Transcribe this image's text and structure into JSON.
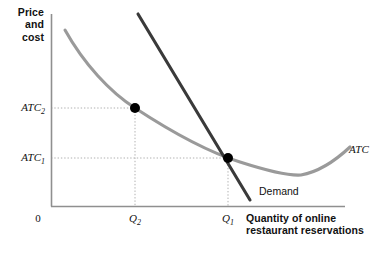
{
  "chart_data": {
    "type": "line",
    "title": "",
    "xlabel": "Quantity of online restaurant reservations",
    "ylabel": "Price and cost",
    "grid": false,
    "legend": "inline-annotations",
    "origin_label": "0",
    "axis_ranges": {
      "x": [
        0,
        1
      ],
      "y": [
        0,
        1
      ]
    },
    "y_ticks": [
      {
        "label": "ATC",
        "subscript": "1",
        "pixel_y": 158
      },
      {
        "label": "ATC",
        "subscript": "2",
        "pixel_y": 108
      }
    ],
    "x_ticks": [
      {
        "label": "Q",
        "subscript": "2",
        "pixel_x": 135
      },
      {
        "label": "Q",
        "subscript": "1",
        "pixel_x": 228
      }
    ],
    "series": [
      {
        "name": "ATC",
        "annotation": "ATC",
        "color": "#9a9a9a",
        "style": "u-shaped-curve",
        "points": [
          [
            65,
            30
          ],
          [
            84,
            60
          ],
          [
            104,
            82
          ],
          [
            135,
            108
          ],
          [
            170,
            131
          ],
          [
            200,
            147
          ],
          [
            228,
            158
          ],
          [
            258,
            167
          ],
          [
            285,
            173
          ],
          [
            300,
            175
          ],
          [
            318,
            170
          ],
          [
            334,
            160
          ],
          [
            350,
            147
          ]
        ]
      },
      {
        "name": "Demand",
        "annotation": "Demand",
        "color": "#3a3a3a",
        "style": "straight-downward-sloping",
        "points": [
          [
            138,
            14
          ],
          [
            250,
            200
          ]
        ]
      }
    ],
    "markers": [
      {
        "name": "equilibrium-high-cost",
        "x_label": "Q2",
        "y_label": "ATC2",
        "pixel": [
          135,
          108
        ],
        "color": "#000000"
      },
      {
        "name": "equilibrium-low-cost",
        "x_label": "Q1",
        "y_label": "ATC1",
        "pixel": [
          228,
          158
        ],
        "color": "#000000"
      }
    ],
    "guide_lines": {
      "color": "#b0b0b0",
      "style": "dotted",
      "lines": [
        {
          "from": [
            51,
            108
          ],
          "to": [
            135,
            108
          ]
        },
        {
          "from": [
            135,
            108
          ],
          "to": [
            135,
            206
          ]
        },
        {
          "from": [
            51,
            158
          ],
          "to": [
            228,
            158
          ]
        },
        {
          "from": [
            228,
            158
          ],
          "to": [
            228,
            206
          ]
        }
      ]
    },
    "colors": {
      "axis": "#8f8f8f",
      "atc_curve": "#9a9a9a",
      "demand_line": "#3a3a3a",
      "marker": "#000000",
      "guide": "#b0b0b0",
      "text": "#111111"
    }
  },
  "axes": {
    "y_title": "Price\nand\ncost",
    "x_title": "Quantity of online\nrestaurant reservations",
    "origin": "0"
  },
  "ticks": {
    "y": {
      "atc2_base": "ATC",
      "atc2_sub": "2",
      "atc1_base": "ATC",
      "atc1_sub": "1"
    },
    "x": {
      "q2_base": "Q",
      "q2_sub": "2",
      "q1_base": "Q",
      "q1_sub": "1"
    }
  },
  "annotations": {
    "atc_curve": "ATC",
    "demand_line": "Demand"
  }
}
